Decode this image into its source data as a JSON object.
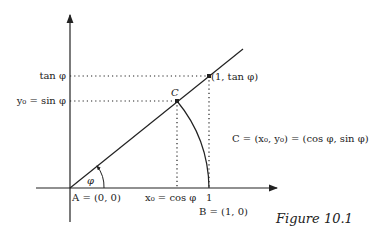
{
  "figure": {
    "caption": "Figure 10.1",
    "labels": {
      "tan_axis": "tan φ",
      "sin_axis": "y₀ = sin φ",
      "point_c": "C",
      "tan_point": "(1, tan φ)",
      "c_definition": "C = (x₀, y₀) = (cos φ, sin φ)",
      "angle": "φ",
      "origin": "A = (0, 0)",
      "cos_axis": "x₀ = cos φ",
      "one_tick": "1",
      "point_b": "B = (1, 0)"
    },
    "colors": {
      "ink": "#222222",
      "background": "#ffffff"
    }
  }
}
